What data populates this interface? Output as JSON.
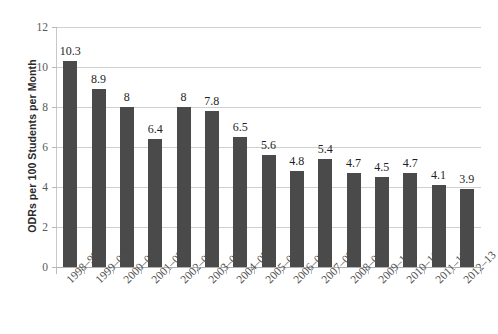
{
  "chart_data": {
    "type": "bar",
    "title": "",
    "xlabel": "",
    "ylabel": "ODRs per 100 Students per Month",
    "ylim": [
      0,
      12
    ],
    "ytick_values": [
      0,
      2,
      4,
      6,
      8,
      10,
      12
    ],
    "ytick_labels": [
      "0",
      "2",
      "4",
      "6",
      "8",
      "10",
      "12"
    ],
    "grid": true,
    "legend": "none",
    "bar_color": "#4a4a4a",
    "gridline_color": "#d0d0d0",
    "categories": [
      "1998–99",
      "1999–00",
      "2000–01",
      "2001–02",
      "2002–03",
      "2003–04",
      "2004–05",
      "2005–06",
      "2006–07",
      "2007–08",
      "2008–09",
      "2009–10",
      "2010–11",
      "2011–12",
      "2012–13"
    ],
    "values": [
      10.3,
      8.9,
      8,
      6.4,
      8,
      7.8,
      6.5,
      5.6,
      4.8,
      5.4,
      4.7,
      4.5,
      4.7,
      4.1,
      3.9
    ],
    "data_labels": [
      "10.3",
      "8.9",
      "8",
      "6.4",
      "8",
      "7.8",
      "6.5",
      "5.6",
      "4.8",
      "5.4",
      "4.7",
      "4.5",
      "4.7",
      "4.1",
      "3.9"
    ]
  }
}
